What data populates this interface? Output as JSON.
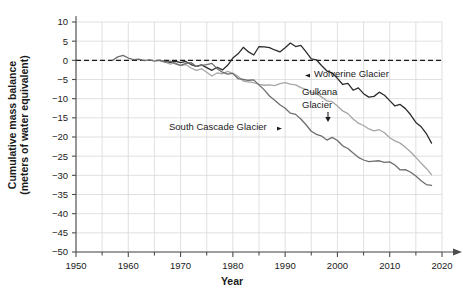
{
  "chart_data": {
    "type": "line",
    "title": "",
    "xlabel": "Year",
    "ylabel_line1": "Cumulative mass balance",
    "ylabel_line2": "(meters of water equivalent)",
    "xlim": [
      1950,
      2020
    ],
    "ylim": [
      -50,
      10
    ],
    "xticks": [
      1950,
      1960,
      1970,
      1980,
      1990,
      2000,
      2010,
      2020
    ],
    "yticks": [
      10,
      5,
      0,
      -5,
      -10,
      -15,
      -20,
      -25,
      -30,
      -35,
      -40,
      -45,
      -50
    ],
    "xtick_labels": [
      "1950",
      "1960",
      "1970",
      "1980",
      "1990",
      "2000",
      "2010",
      "2020"
    ],
    "ytick_labels": [
      "10",
      "5",
      "0",
      "-5",
      "-10",
      "-15",
      "-20",
      "-25",
      "-30",
      "-35",
      "-40",
      "-45",
      "-50"
    ],
    "grid": true,
    "minor_xtick_interval": 5,
    "zero_reference_line": 0,
    "zero_line_style": "dashed",
    "legend": "annotations",
    "annotations": [
      {
        "text": "Wolverine Glacier",
        "marker": "left-triangle",
        "marker_side": "left",
        "x": 1996,
        "y": -6
      },
      {
        "text": "Gulkana",
        "text2": "Glacier",
        "marker": "down-arrow",
        "marker_side": "below",
        "x": 2000,
        "y": -9
      },
      {
        "text": "South Cascade Glacier",
        "marker": "right-triangle",
        "marker_side": "right",
        "x": 1982,
        "y": -19
      }
    ],
    "series": [
      {
        "name": "Wolverine Glacier",
        "color": "#2b2b2b",
        "x": [
          1966,
          1967,
          1968,
          1969,
          1970,
          1971,
          1972,
          1973,
          1974,
          1975,
          1976,
          1977,
          1978,
          1979,
          1980,
          1981,
          1982,
          1983,
          1984,
          1985,
          1986,
          1987,
          1988,
          1989,
          1990,
          1991,
          1992,
          1993,
          1994,
          1995,
          1996,
          1997,
          1998,
          1999,
          2000,
          2001,
          2002,
          2003,
          2004,
          2005,
          2006,
          2007,
          2008,
          2009,
          2010,
          2011,
          2012,
          2013,
          2014,
          2015,
          2016,
          2017,
          2018
        ],
        "values": [
          0,
          -0.3,
          -0.5,
          -0.2,
          -0.6,
          -0.3,
          -1.1,
          -1.6,
          -1.2,
          -1.9,
          -2.6,
          -1.8,
          -2.5,
          -1.3,
          0.6,
          1.7,
          3.4,
          2.2,
          1.4,
          3.6,
          3.5,
          3.3,
          2.7,
          2.2,
          3.3,
          4.5,
          3.6,
          3.9,
          2.2,
          0.4,
          0.1,
          -1.4,
          -2.8,
          -3.3,
          -4.7,
          -6.3,
          -6.0,
          -7.8,
          -7.2,
          -8.7,
          -9.6,
          -9.4,
          -8.3,
          -9.1,
          -10.5,
          -11.9,
          -11.5,
          -12.6,
          -14.2,
          -16.2,
          -17.3,
          -19.1,
          -21.6
        ]
      },
      {
        "name": "Gulkana Glacier",
        "color": "#a6a6a6",
        "x": [
          1966,
          1967,
          1968,
          1969,
          1970,
          1971,
          1972,
          1973,
          1974,
          1975,
          1976,
          1977,
          1978,
          1979,
          1980,
          1981,
          1982,
          1983,
          1984,
          1985,
          1986,
          1987,
          1988,
          1989,
          1990,
          1991,
          1992,
          1993,
          1994,
          1995,
          1996,
          1997,
          1998,
          1999,
          2000,
          2001,
          2002,
          2003,
          2004,
          2005,
          2006,
          2007,
          2008,
          2009,
          2010,
          2011,
          2012,
          2013,
          2014,
          2015,
          2016,
          2017,
          2018
        ],
        "values": [
          0,
          -0.4,
          -1.0,
          -0.6,
          -1.4,
          -1.1,
          -2.0,
          -2.6,
          -2.2,
          -3.1,
          -4.1,
          -3.3,
          -3.5,
          -2.9,
          -3.4,
          -4.2,
          -5.4,
          -5.6,
          -5.8,
          -6.3,
          -6.5,
          -6.4,
          -6.6,
          -6.1,
          -5.8,
          -6.2,
          -6.4,
          -7.1,
          -7.6,
          -8.4,
          -8.6,
          -9.6,
          -10.6,
          -10.8,
          -11.9,
          -13.2,
          -13.9,
          -15.3,
          -16.4,
          -17.0,
          -17.9,
          -18.4,
          -18.1,
          -18.9,
          -20.2,
          -21.0,
          -21.6,
          -22.7,
          -23.9,
          -25.3,
          -26.8,
          -28.2,
          -29.8
        ]
      },
      {
        "name": "South Cascade Glacier",
        "color": "#6e6e6e",
        "x": [
          1957,
          1958,
          1959,
          1960,
          1961,
          1962,
          1963,
          1964,
          1965,
          1966,
          1967,
          1968,
          1969,
          1970,
          1971,
          1972,
          1973,
          1974,
          1975,
          1976,
          1977,
          1978,
          1979,
          1980,
          1981,
          1982,
          1983,
          1984,
          1985,
          1986,
          1987,
          1988,
          1989,
          1990,
          1991,
          1992,
          1993,
          1994,
          1995,
          1996,
          1997,
          1998,
          1999,
          2000,
          2001,
          2002,
          2003,
          2004,
          2005,
          2006,
          2007,
          2008,
          2009,
          2010,
          2011,
          2012,
          2013,
          2014,
          2015,
          2016,
          2017,
          2018
        ],
        "values": [
          0,
          0.9,
          1.3,
          0.6,
          0.2,
          0.3,
          -0.1,
          0.1,
          -0.2,
          0,
          -0.5,
          -0.2,
          -0.9,
          -1.3,
          -0.8,
          -0.6,
          -1.6,
          -1.3,
          -1.1,
          -0.8,
          -2.2,
          -3.1,
          -3.6,
          -3.4,
          -4.8,
          -5.0,
          -5.2,
          -5.1,
          -6.4,
          -7.7,
          -9.3,
          -10.4,
          -11.6,
          -12.5,
          -13.8,
          -14.1,
          -15.3,
          -16.8,
          -18.5,
          -19.3,
          -19.8,
          -20.8,
          -20.1,
          -20.9,
          -22.3,
          -23.0,
          -24.2,
          -25.3,
          -26.0,
          -26.4,
          -26.3,
          -26.2,
          -26.6,
          -26.5,
          -27.3,
          -28.6,
          -28.5,
          -29.2,
          -30.2,
          -31.4,
          -32.4,
          -32.6
        ]
      }
    ]
  }
}
